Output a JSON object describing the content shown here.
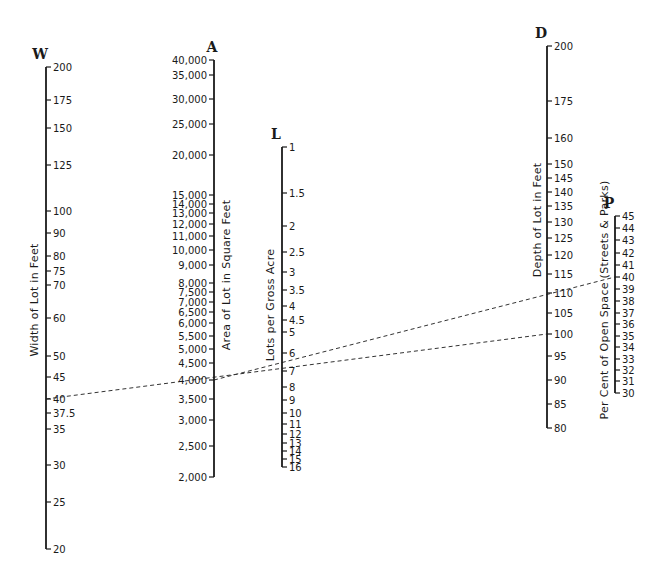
{
  "chart_data": {
    "type": "nomogram",
    "title": "",
    "axes": [
      {
        "id": "W",
        "title": "W",
        "caption": "Width of Lot in Feet",
        "x": 46,
        "ticks": [
          {
            "label": "200",
            "y": 67
          },
          {
            "label": "175",
            "y": 100
          },
          {
            "label": "150",
            "y": 128
          },
          {
            "label": "125",
            "y": 165
          },
          {
            "label": "100",
            "y": 211
          },
          {
            "label": "90",
            "y": 233
          },
          {
            "label": "80",
            "y": 256
          },
          {
            "label": "75",
            "y": 271
          },
          {
            "label": "70",
            "y": 285
          },
          {
            "label": "60",
            "y": 318
          },
          {
            "label": "50",
            "y": 356
          },
          {
            "label": "45",
            "y": 377
          },
          {
            "label": "40",
            "y": 399
          },
          {
            "label": "37.5",
            "y": 413
          },
          {
            "label": "35",
            "y": 429
          },
          {
            "label": "30",
            "y": 465
          },
          {
            "label": "25",
            "y": 502
          },
          {
            "label": "20",
            "y": 549
          }
        ],
        "label_side": "right",
        "caption_x": 38,
        "caption_y": 300
      },
      {
        "id": "A",
        "title": "A",
        "caption": "Area of Lot in Square Feet",
        "x": 214,
        "ticks": [
          {
            "label": "40,000",
            "y": 60
          },
          {
            "label": "35,000",
            "y": 75
          },
          {
            "label": "30,000",
            "y": 99
          },
          {
            "label": "25,000",
            "y": 124
          },
          {
            "label": "20,000",
            "y": 155
          },
          {
            "label": "15,000",
            "y": 195
          },
          {
            "label": "14,000",
            "y": 204
          },
          {
            "label": "13,000",
            "y": 213
          },
          {
            "label": "12,000",
            "y": 224
          },
          {
            "label": "11,000",
            "y": 236
          },
          {
            "label": "10,000",
            "y": 250
          },
          {
            "label": "9,000",
            "y": 265
          },
          {
            "label": "8,000",
            "y": 283
          },
          {
            "label": "7,500",
            "y": 292
          },
          {
            "label": "7,000",
            "y": 302
          },
          {
            "label": "6,500",
            "y": 312
          },
          {
            "label": "6,000",
            "y": 323
          },
          {
            "label": "5,500",
            "y": 336
          },
          {
            "label": "5,000",
            "y": 349
          },
          {
            "label": "4,500",
            "y": 363
          },
          {
            "label": "4,000",
            "y": 380
          },
          {
            "label": "3,500",
            "y": 399
          },
          {
            "label": "3,000",
            "y": 420
          },
          {
            "label": "2,500",
            "y": 446
          },
          {
            "label": "2,000",
            "y": 477
          }
        ],
        "label_side": "left",
        "caption_x": 230,
        "caption_y": 275
      },
      {
        "id": "L",
        "title": "L",
        "caption": "Lots per Gross Acre",
        "x": 282,
        "ticks": [
          {
            "label": "1",
            "y": 147
          },
          {
            "label": "1.5",
            "y": 193
          },
          {
            "label": "2",
            "y": 226
          },
          {
            "label": "2.5",
            "y": 252
          },
          {
            "label": "3",
            "y": 272
          },
          {
            "label": "3.5",
            "y": 290
          },
          {
            "label": "4",
            "y": 306
          },
          {
            "label": "4.5",
            "y": 320
          },
          {
            "label": "5",
            "y": 332
          },
          {
            "label": "6",
            "y": 353
          },
          {
            "label": "7",
            "y": 371
          },
          {
            "label": "8",
            "y": 387
          },
          {
            "label": "9",
            "y": 400
          },
          {
            "label": "10",
            "y": 413
          },
          {
            "label": "11",
            "y": 424
          },
          {
            "label": "12",
            "y": 434
          },
          {
            "label": "13",
            "y": 443
          },
          {
            "label": "14",
            "y": 451
          },
          {
            "label": "15",
            "y": 459
          },
          {
            "label": "16",
            "y": 467
          }
        ],
        "label_side": "right",
        "caption_x": 274,
        "caption_y": 305
      },
      {
        "id": "D",
        "title": "D",
        "caption": "Depth of Lot in Feet",
        "x": 547,
        "ticks": [
          {
            "label": "200",
            "y": 46
          },
          {
            "label": "175",
            "y": 101
          },
          {
            "label": "160",
            "y": 138
          },
          {
            "label": "150",
            "y": 164
          },
          {
            "label": "145",
            "y": 178
          },
          {
            "label": "140",
            "y": 192
          },
          {
            "label": "135",
            "y": 206
          },
          {
            "label": "130",
            "y": 222
          },
          {
            "label": "125",
            "y": 238
          },
          {
            "label": "120",
            "y": 255
          },
          {
            "label": "115",
            "y": 274
          },
          {
            "label": "110",
            "y": 293
          },
          {
            "label": "105",
            "y": 313
          },
          {
            "label": "100",
            "y": 334
          },
          {
            "label": "95",
            "y": 356
          },
          {
            "label": "90",
            "y": 380
          },
          {
            "label": "85",
            "y": 404
          },
          {
            "label": "80",
            "y": 428
          }
        ],
        "label_side": "right",
        "caption_x": 541,
        "caption_y": 220
      },
      {
        "id": "P",
        "title": "P",
        "caption": "Per Cent of Open Space (Streets & Parks)",
        "x": 615,
        "ticks": [
          {
            "label": "45",
            "y": 216
          },
          {
            "label": "44",
            "y": 228
          },
          {
            "label": "43",
            "y": 240
          },
          {
            "label": "42",
            "y": 253
          },
          {
            "label": "41",
            "y": 265
          },
          {
            "label": "40",
            "y": 277
          },
          {
            "label": "39",
            "y": 289
          },
          {
            "label": "38",
            "y": 301
          },
          {
            "label": "37",
            "y": 313
          },
          {
            "label": "36",
            "y": 324
          },
          {
            "label": "35",
            "y": 336
          },
          {
            "label": "34",
            "y": 347
          },
          {
            "label": "33",
            "y": 359
          },
          {
            "label": "32",
            "y": 370
          },
          {
            "label": "31",
            "y": 381
          },
          {
            "label": "30",
            "y": 393
          }
        ],
        "label_side": "right",
        "caption_x": 608,
        "caption_y": 300
      }
    ],
    "example_lines": [
      {
        "from": {
          "axis": "W",
          "value": "40",
          "x": 46,
          "y": 399
        },
        "through": {
          "axis": "A",
          "value": "4,000",
          "x": 214,
          "y": 380
        },
        "to": {
          "axis": "D",
          "value": "100",
          "x": 547,
          "y": 334
        }
      },
      {
        "from": {
          "axis": "A",
          "value": "4,000",
          "x": 214,
          "y": 380
        },
        "through": {
          "axis": "D",
          "value": "110",
          "x": 547,
          "y": 293
        },
        "to": {
          "axis": "P",
          "value": "40",
          "x": 615,
          "y": 277
        }
      }
    ]
  }
}
